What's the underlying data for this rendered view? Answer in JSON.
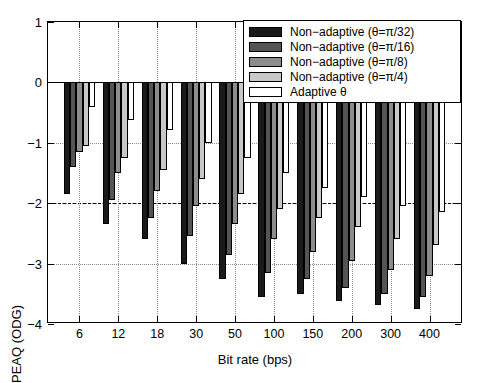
{
  "chart_data": {
    "type": "bar",
    "title": "",
    "xlabel": "Bit rate (bps)",
    "ylabel": "PEAQ (ODG)",
    "categories": [
      "6",
      "12",
      "18",
      "30",
      "50",
      "100",
      "150",
      "200",
      "300",
      "400"
    ],
    "ylim": [
      -4,
      1
    ],
    "yticks": [
      1,
      0,
      -1,
      -2,
      -3,
      -4
    ],
    "ytick_labels": [
      "1",
      "0",
      "-1",
      "-2",
      "-3",
      "-4"
    ],
    "grid": true,
    "grid_style": "dotted",
    "reference_line": -2,
    "legend_position": "top-right",
    "series": [
      {
        "name": "Non-adaptive (θ=π/32)",
        "color": "#1a1a1a",
        "values": [
          -1.85,
          -2.35,
          -2.6,
          -3.0,
          -3.25,
          -3.55,
          -3.5,
          -3.62,
          -3.68,
          -3.75
        ]
      },
      {
        "name": "Non-adaptive (θ=π/16)",
        "color": "#545454",
        "values": [
          -1.4,
          -1.95,
          -2.25,
          -2.55,
          -2.85,
          -3.15,
          -3.25,
          -3.4,
          -3.5,
          -3.55
        ]
      },
      {
        "name": "Non-adaptive (θ=π/8)",
        "color": "#8c8c8c",
        "values": [
          -1.15,
          -1.5,
          -1.8,
          -2.05,
          -2.35,
          -2.6,
          -2.8,
          -2.95,
          -3.1,
          -3.2
        ]
      },
      {
        "name": "Non-adaptive (θ=π/4)",
        "color": "#c8c8c8",
        "values": [
          -1.05,
          -1.25,
          -1.45,
          -1.6,
          -1.85,
          -2.1,
          -2.25,
          -2.4,
          -2.6,
          -2.7
        ]
      },
      {
        "name": "Adaptive θ",
        "color": "#ffffff",
        "values": [
          -0.4,
          -0.62,
          -0.78,
          -1.0,
          -1.25,
          -1.5,
          -1.75,
          -1.9,
          -2.05,
          -2.15
        ]
      }
    ]
  },
  "legend": {
    "items": [
      {
        "label": "Non-adaptive (θ=π/32)",
        "color": "#1a1a1a"
      },
      {
        "label": "Non-adaptive (θ=π/16)",
        "color": "#545454"
      },
      {
        "label": "Non-adaptive (θ=π/8)",
        "color": "#8c8c8c"
      },
      {
        "label": "Non-adaptive (θ=π/4)",
        "color": "#c8c8c8"
      },
      {
        "label": "Adaptive θ",
        "color": "#ffffff"
      }
    ]
  }
}
